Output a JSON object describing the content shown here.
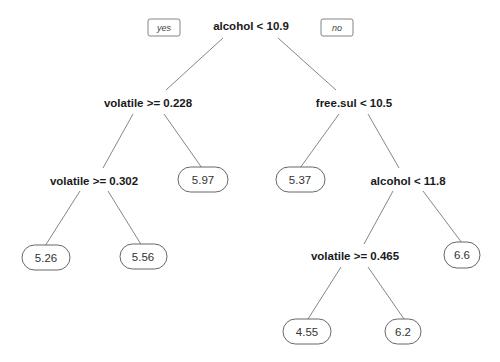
{
  "tree": {
    "branch_labels": {
      "left": "yes",
      "right": "no"
    },
    "nodes": {
      "root": {
        "label": "alcohol < 10.9"
      },
      "n2": {
        "label": "volatile >= 0.228"
      },
      "n3": {
        "label": "free.sul < 10.5"
      },
      "n4": {
        "label": "volatile >= 0.302"
      },
      "n7": {
        "label": "alcohol < 11.8"
      },
      "n14": {
        "label": "volatile >= 0.465"
      }
    },
    "leaves": {
      "l8": {
        "value": "5.26"
      },
      "l9": {
        "value": "5.56"
      },
      "l5": {
        "value": "5.97"
      },
      "l6": {
        "value": "5.37"
      },
      "l28": {
        "value": "4.55"
      },
      "l29": {
        "value": "6.2"
      },
      "l15": {
        "value": "6.6"
      }
    }
  },
  "colors": {
    "edge": "#777777",
    "text": "#1a1a1a",
    "leaf_border": "#555555"
  }
}
